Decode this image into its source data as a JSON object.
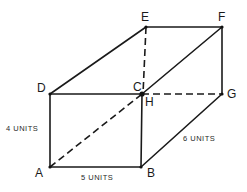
{
  "figure": {
    "vertices": {
      "A": "A",
      "B": "B",
      "C": "C",
      "D": "D",
      "E": "E",
      "F": "F",
      "G": "G",
      "H": "H"
    },
    "dimensions": {
      "height": "4 UNITS",
      "length": "5 UNITS",
      "depth": "6 UNITS"
    },
    "solid_edges": [
      [
        "D",
        "E"
      ],
      [
        "E",
        "F"
      ],
      [
        "F",
        "G"
      ],
      [
        "D",
        "C"
      ],
      [
        "A",
        "D"
      ],
      [
        "A",
        "B"
      ],
      [
        "B",
        "H"
      ],
      [
        "B",
        "G"
      ],
      [
        "C",
        "F"
      ]
    ],
    "dashed_edges": [
      [
        "E",
        "C"
      ],
      [
        "C",
        "G"
      ],
      [
        "A",
        "H"
      ]
    ],
    "colors": {
      "line": "#1a1a1a",
      "background": "#ffffff"
    }
  }
}
